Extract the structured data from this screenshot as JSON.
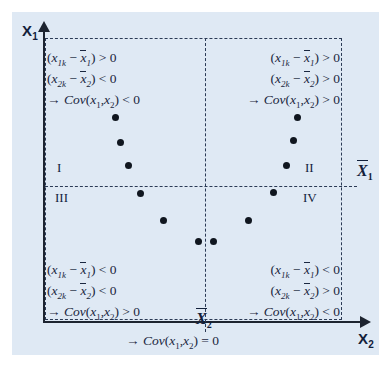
{
  "figure": {
    "background_color": "#dfe9f4",
    "axis_color": "#1d2430",
    "dash_color": "#2b3a55",
    "point_color": "#10161f"
  },
  "axes": {
    "y_label": "X",
    "y_label_sub": "1",
    "x_label": "X",
    "x_label_sub": "2",
    "mean_y_label": "X",
    "mean_y_sub": "1",
    "mean_x_label": "X",
    "mean_x_sub": "2"
  },
  "quadrants": [
    {
      "id": "I",
      "numeral": "I",
      "lines": [
        "(x1k − x̄1) > 0",
        "(x2k − x̄2) < 0",
        "→ Cov(x1,x2) < 0"
      ]
    },
    {
      "id": "II",
      "numeral": "II",
      "lines": [
        "(x1k − x̄1) > 0",
        "(x2k − x̄2) > 0",
        "→ Cov(x1,x2) > 0"
      ]
    },
    {
      "id": "III",
      "numeral": "III",
      "lines": [
        "(x1k − x̄1) < 0",
        "(x2k − x̄2) < 0",
        "→ Cov(x1,x2) > 0"
      ]
    },
    {
      "id": "IV",
      "numeral": "IV",
      "lines": [
        "(x1k − x̄1) < 0",
        "(x2k − x̄2) > 0",
        "→ Cov(x1,x2) < 0"
      ]
    }
  ],
  "conclusion": "→ Cov(x1,x2) = 0",
  "chart_data": {
    "type": "scatter",
    "xlabel": "X2",
    "ylabel": "X1",
    "grid": false,
    "legend": "none",
    "mean_lines": {
      "x_mean_px": 205,
      "y_mean_px": 186
    },
    "points_px": [
      {
        "x": 115,
        "y": 117,
        "quadrant": "I"
      },
      {
        "x": 120,
        "y": 142,
        "quadrant": "I"
      },
      {
        "x": 128,
        "y": 165,
        "quadrant": "I"
      },
      {
        "x": 140,
        "y": 193,
        "quadrant": "III"
      },
      {
        "x": 163,
        "y": 220,
        "quadrant": "III"
      },
      {
        "x": 198,
        "y": 241,
        "quadrant": "III"
      },
      {
        "x": 213,
        "y": 241,
        "quadrant": "IV"
      },
      {
        "x": 248,
        "y": 220,
        "quadrant": "IV"
      },
      {
        "x": 273,
        "y": 192,
        "quadrant": "IV"
      },
      {
        "x": 286,
        "y": 165,
        "quadrant": "II"
      },
      {
        "x": 293,
        "y": 140,
        "quadrant": "II"
      },
      {
        "x": 297,
        "y": 117,
        "quadrant": "II"
      }
    ]
  }
}
